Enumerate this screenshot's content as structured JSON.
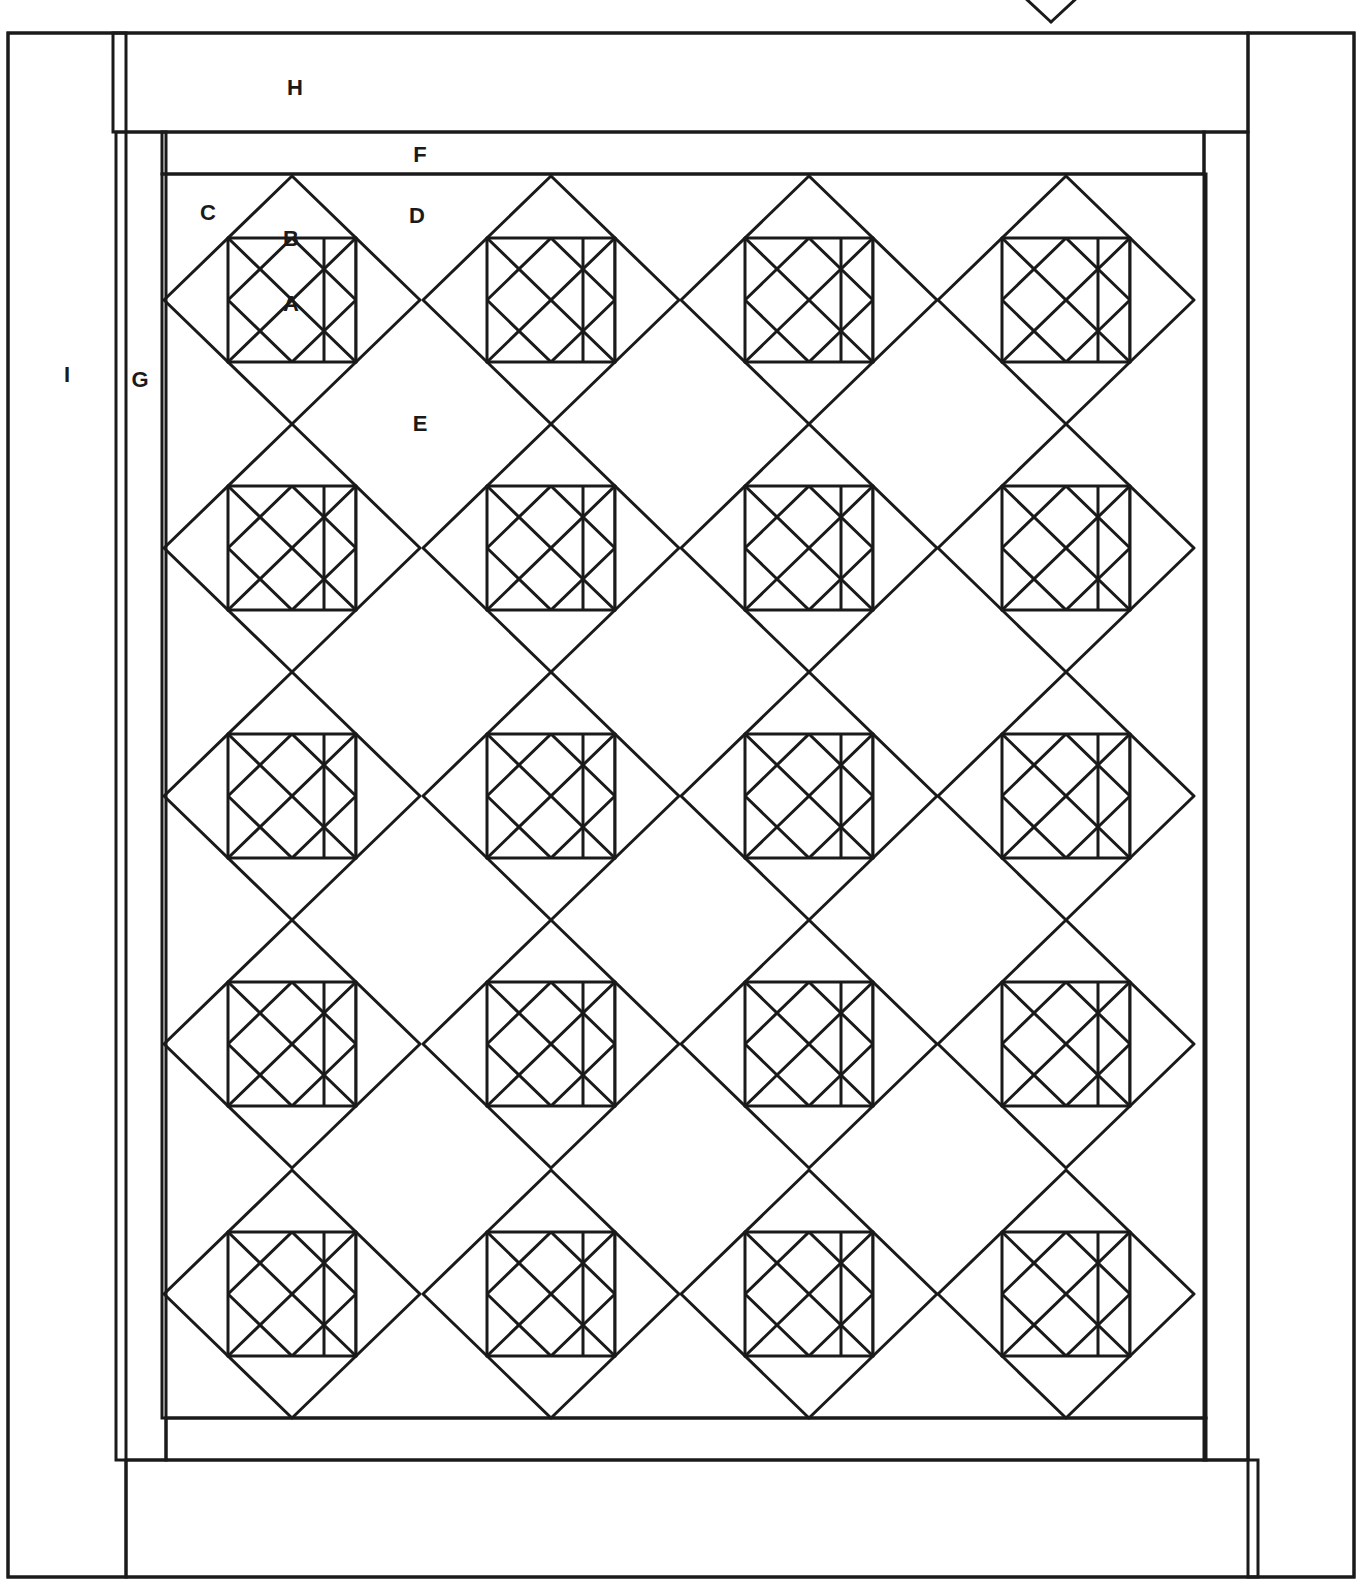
{
  "diagram": {
    "title": "",
    "type": "quilt-layout",
    "ink_color": "#1a1a1a",
    "background": "#ffffff",
    "stroke_width": 3
  },
  "frame": {
    "outer_border": {
      "x1": 8,
      "y1": 33,
      "x2": 1354,
      "y2": 1577
    },
    "border_top_H": {
      "x1": 113,
      "y1": 33,
      "x2": 1248,
      "y2": 132
    },
    "border_bottom": {
      "x1": 126,
      "y1": 1460,
      "x2": 1258,
      "y2": 1577
    },
    "border_left_I": {
      "x1": 8,
      "y1": 33,
      "x2": 126,
      "y2": 1577
    },
    "border_right": {
      "x1": 1248,
      "y1": 33,
      "x2": 1354,
      "y2": 1577
    },
    "sashing_left_G": {
      "x1": 116,
      "y1": 132,
      "x2": 166,
      "y2": 1460
    },
    "sashing_right": {
      "x1": 1204,
      "y1": 132,
      "x2": 1248,
      "y2": 1460
    },
    "strip_top_F": {
      "x1": 162,
      "y1": 132,
      "x2": 1204,
      "y2": 174
    },
    "strip_bottom": {
      "x1": 166,
      "y1": 1418,
      "x2": 1206,
      "y2": 1460
    },
    "center_field": {
      "x1": 162,
      "y1": 174,
      "x2": 1206,
      "y2": 1418
    }
  },
  "blocks": {
    "half_width": 128,
    "half_height": 124,
    "columns_cx": [
      292,
      551,
      809,
      1066
    ],
    "rows_cy": [
      300,
      548,
      796,
      1044,
      1294
    ],
    "count": 20
  },
  "overflow_diamond": {
    "cx": 1051,
    "cy": 0,
    "half_width": 28,
    "half_height": 22
  },
  "labels": [
    {
      "text": "H",
      "x": 295,
      "y": 95,
      "meaning": "top border"
    },
    {
      "text": "F",
      "x": 420,
      "y": 162,
      "meaning": "inner top strip"
    },
    {
      "text": "C",
      "x": 208,
      "y": 220,
      "meaning": "corner setting triangle"
    },
    {
      "text": "B",
      "x": 291,
      "y": 246,
      "meaning": "small triangle"
    },
    {
      "text": "D",
      "x": 417,
      "y": 223,
      "meaning": "side setting triangle"
    },
    {
      "text": "A",
      "x": 291,
      "y": 311,
      "meaning": "block square"
    },
    {
      "text": "I",
      "x": 67,
      "y": 382,
      "meaning": "outer side border"
    },
    {
      "text": "G",
      "x": 140,
      "y": 387,
      "meaning": "inner side strip"
    },
    {
      "text": "E",
      "x": 420,
      "y": 431,
      "meaning": "setting square"
    }
  ]
}
